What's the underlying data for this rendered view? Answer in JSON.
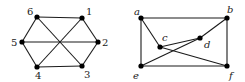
{
  "graphs": [
    {
      "id": "left",
      "label_style": "numeric",
      "nodes": [
        {
          "id": "1",
          "label": "1"
        },
        {
          "id": "2",
          "label": "2"
        },
        {
          "id": "3",
          "label": "3"
        },
        {
          "id": "4",
          "label": "4"
        },
        {
          "id": "5",
          "label": "5"
        },
        {
          "id": "6",
          "label": "6"
        }
      ],
      "edges": [
        [
          "6",
          "1"
        ],
        [
          "1",
          "2"
        ],
        [
          "2",
          "3"
        ],
        [
          "3",
          "4"
        ],
        [
          "4",
          "5"
        ],
        [
          "5",
          "6"
        ],
        [
          "6",
          "3"
        ],
        [
          "1",
          "4"
        ],
        [
          "5",
          "2"
        ]
      ]
    },
    {
      "id": "right",
      "label_style": "italic",
      "nodes": [
        {
          "id": "a",
          "label": "a"
        },
        {
          "id": "b",
          "label": "b"
        },
        {
          "id": "c",
          "label": "c"
        },
        {
          "id": "d",
          "label": "d"
        },
        {
          "id": "e",
          "label": "e"
        },
        {
          "id": "f",
          "label": "f"
        }
      ],
      "edges": [
        [
          "a",
          "b"
        ],
        [
          "b",
          "f"
        ],
        [
          "f",
          "e"
        ],
        [
          "e",
          "a"
        ],
        [
          "a",
          "c"
        ],
        [
          "c",
          "f"
        ],
        [
          "c",
          "d"
        ],
        [
          "d",
          "b"
        ],
        [
          "d",
          "e"
        ]
      ]
    }
  ]
}
